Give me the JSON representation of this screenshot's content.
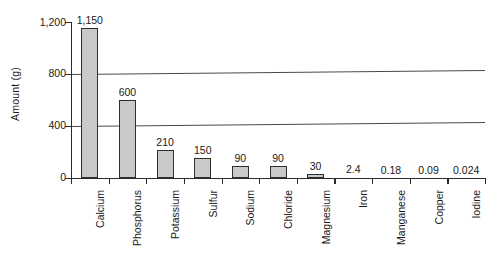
{
  "chart_data": {
    "type": "bar",
    "title": "",
    "xlabel": "",
    "ylabel": "Amount (g)",
    "ylim": [
      0,
      1200
    ],
    "yticks": [
      0,
      400,
      800,
      1200
    ],
    "ytick_labels": [
      "0",
      "400",
      "800",
      "1,200"
    ],
    "gridlines": [
      400,
      800
    ],
    "grid": true,
    "legend": null,
    "categories": [
      "Calcium",
      "Phosphorus",
      "Potassium",
      "Sulfur",
      "Sodium",
      "Chloride",
      "Magnesium",
      "Iron",
      "Manganese",
      "Copper",
      "Iodine"
    ],
    "values": [
      1150,
      600,
      210,
      150,
      90,
      90,
      30,
      2.4,
      0.18,
      0.09,
      0.024
    ],
    "value_labels": [
      "1,150",
      "600",
      "210",
      "150",
      "90",
      "90",
      "30",
      "2.4",
      "0.18",
      "0.09",
      "0.024"
    ],
    "bar_fill_color": "#c9c9c9",
    "bar_border_color": "#2e2e2e",
    "axis_color": "#2a2a2a"
  }
}
